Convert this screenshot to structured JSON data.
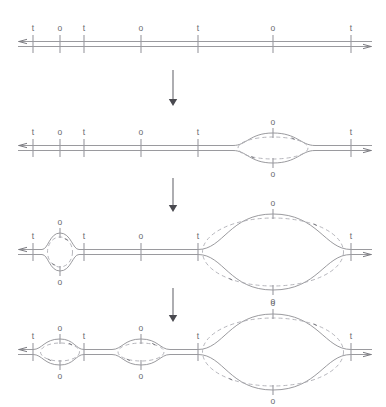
{
  "figure": {
    "width": 386,
    "height": 407,
    "background_color": "#ffffff",
    "line_color": "#8e8e93",
    "label_color": "#6a6a70",
    "dashed_color": "#a9a9b0",
    "arrow_color": "#4a4a50"
  },
  "site_labels": {
    "terminus": "t",
    "origin": "o"
  },
  "axis": {
    "x_start": 18,
    "x_end": 372,
    "strand_gap": 5,
    "left_arrow_direction": "left",
    "right_arrow_direction": "right"
  },
  "tick_positions": [
    33,
    60,
    84,
    141,
    198,
    273,
    351
  ],
  "stages": [
    {
      "index": 1,
      "name": "stage-1-unopened",
      "baseline_y": 44,
      "sites": [
        {
          "x": 33,
          "label": "t",
          "type": "terminus"
        },
        {
          "x": 60,
          "label": "o",
          "type": "origin"
        },
        {
          "x": 84,
          "label": "t",
          "type": "terminus"
        },
        {
          "x": 141,
          "label": "o",
          "type": "origin"
        },
        {
          "x": 198,
          "label": "t",
          "type": "terminus"
        },
        {
          "x": 273,
          "label": "o",
          "type": "origin"
        },
        {
          "x": 351,
          "label": "t",
          "type": "terminus"
        }
      ],
      "bubbles": []
    },
    {
      "index": 2,
      "name": "stage-2-one-bubble",
      "baseline_y": 148,
      "sites": [
        {
          "x": 33,
          "label": "t",
          "type": "terminus"
        },
        {
          "x": 60,
          "label": "o",
          "type": "origin"
        },
        {
          "x": 84,
          "label": "t",
          "type": "terminus"
        },
        {
          "x": 141,
          "label": "o",
          "type": "origin"
        },
        {
          "x": 198,
          "label": "t",
          "type": "terminus"
        },
        {
          "x": 273,
          "label": "o",
          "type": "origin"
        },
        {
          "x": 351,
          "label": "t",
          "type": "terminus"
        }
      ],
      "bubbles": [
        {
          "center_x": 273,
          "left_x": 233,
          "right_x": 315,
          "half_height": 15,
          "origin_label": "o"
        }
      ]
    },
    {
      "index": 3,
      "name": "stage-3-two-bubbles",
      "baseline_y": 252,
      "sites": [
        {
          "x": 33,
          "label": "t",
          "type": "terminus"
        },
        {
          "x": 60,
          "label": "o",
          "type": "origin"
        },
        {
          "x": 84,
          "label": "t",
          "type": "terminus"
        },
        {
          "x": 141,
          "label": "o",
          "type": "origin"
        },
        {
          "x": 198,
          "label": "t",
          "type": "terminus"
        },
        {
          "x": 273,
          "label": "o",
          "type": "origin"
        },
        {
          "x": 351,
          "label": "t",
          "type": "terminus"
        }
      ],
      "bubbles": [
        {
          "center_x": 60,
          "left_x": 42,
          "right_x": 79,
          "half_height": 19,
          "origin_label": "o"
        },
        {
          "center_x": 273,
          "left_x": 198,
          "right_x": 351,
          "half_height": 38,
          "origin_label": "o"
        }
      ]
    },
    {
      "index": 4,
      "name": "stage-4-three-bubbles",
      "baseline_y": 352,
      "sites": [
        {
          "x": 33,
          "label": "t",
          "type": "terminus"
        },
        {
          "x": 60,
          "label": "o",
          "type": "origin"
        },
        {
          "x": 84,
          "label": "t",
          "type": "terminus"
        },
        {
          "x": 141,
          "label": "o",
          "type": "origin"
        },
        {
          "x": 198,
          "label": "t",
          "type": "terminus"
        },
        {
          "x": 273,
          "label": "o",
          "type": "origin"
        },
        {
          "x": 351,
          "label": "t",
          "type": "terminus"
        }
      ],
      "bubbles": [
        {
          "center_x": 60,
          "left_x": 33,
          "right_x": 84,
          "half_height": 13,
          "origin_label": "o"
        },
        {
          "center_x": 141,
          "left_x": 112,
          "right_x": 170,
          "half_height": 13,
          "origin_label": "o"
        },
        {
          "center_x": 273,
          "left_x": 198,
          "right_x": 351,
          "half_height": 38,
          "origin_label": "o"
        }
      ]
    }
  ],
  "stage_arrows": [
    {
      "name": "stage-arrow-1-to-2",
      "x": 173,
      "y_start": 70,
      "y_end": 106
    },
    {
      "name": "stage-arrow-2-to-3",
      "x": 173,
      "y_start": 178,
      "y_end": 212
    },
    {
      "name": "stage-arrow-3-to-4",
      "x": 173,
      "y_start": 288,
      "y_end": 322
    }
  ]
}
